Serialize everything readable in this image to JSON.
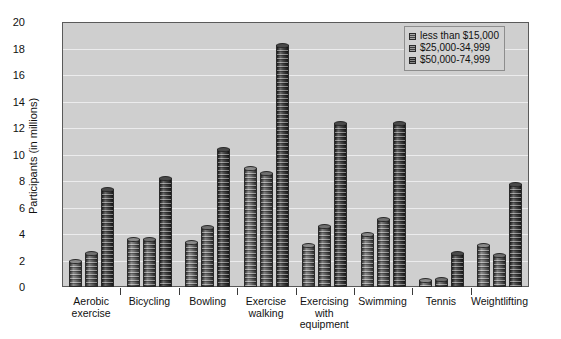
{
  "chart_data": {
    "type": "bar",
    "title": "",
    "xlabel": "",
    "ylabel": "Participants (in millions)",
    "ylim": [
      0,
      20
    ],
    "y_ticks": [
      0,
      2,
      4,
      6,
      8,
      10,
      12,
      14,
      16,
      18,
      20
    ],
    "grid": true,
    "legend_position": "top-right",
    "categories": [
      "Aerobic exercise",
      "Bicycling",
      "Bowling",
      "Exercise walking",
      "Exercising with equipment",
      "Swimming",
      "Tennis",
      "Weightlifting"
    ],
    "category_lines": [
      [
        "Aerobic",
        "exercise"
      ],
      [
        "Bicycling"
      ],
      [
        "Bowling"
      ],
      [
        "Exercise",
        "walking"
      ],
      [
        "Exercising",
        "with",
        "equipment"
      ],
      [
        "Swimming"
      ],
      [
        "Tennis"
      ],
      [
        "Weightlifting"
      ]
    ],
    "series": [
      {
        "name": "less than $15,000",
        "color": "#6e6e6e",
        "values": [
          2.0,
          3.6,
          3.4,
          9.0,
          3.2,
          4.0,
          0.5,
          3.2
        ]
      },
      {
        "name": "$25,000-34,999",
        "color": "#5c5c5c",
        "values": [
          2.6,
          3.6,
          4.5,
          8.6,
          4.6,
          5.1,
          0.6,
          2.4
        ]
      },
      {
        "name": "$50,000-74,999",
        "color": "#3a3a3a",
        "values": [
          7.4,
          8.2,
          10.4,
          18.3,
          12.4,
          12.4,
          2.6,
          7.8
        ]
      }
    ]
  }
}
